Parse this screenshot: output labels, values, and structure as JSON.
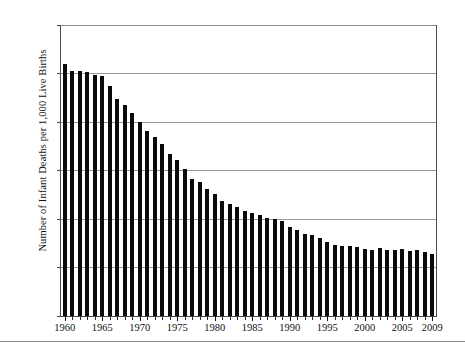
{
  "chart_data": {
    "type": "bar",
    "title": "",
    "subtitle": "",
    "xlabel": "",
    "ylabel": "Number of Infant Deaths per 1,000 Live Births",
    "ylim": [
      0,
      30
    ],
    "ytick_values": [
      0,
      5,
      10,
      15,
      20,
      25,
      30
    ],
    "ytick_labels": [
      "0",
      "5",
      "10",
      "15",
      "20",
      "25",
      "30"
    ],
    "xlim": [
      1960,
      2009
    ],
    "xtick_labels": [
      "1960",
      "1965",
      "1970",
      "1975",
      "1980",
      "1985",
      "1990",
      "1995",
      "2000",
      "2005",
      "2009"
    ],
    "xtick_years": [
      1960,
      1965,
      1970,
      1975,
      1980,
      1985,
      1990,
      1995,
      2000,
      2005,
      2009
    ],
    "grid": "horizontal",
    "legend": "none",
    "bar_color": "#0b0b0b",
    "grid_color": "#9a9a9a",
    "axis_color": "#4a4a4a",
    "categories": [
      "1960",
      "1961",
      "1962",
      "1963",
      "1964",
      "1965",
      "1966",
      "1967",
      "1968",
      "1969",
      "1970",
      "1971",
      "1972",
      "1973",
      "1974",
      "1975",
      "1976",
      "1977",
      "1978",
      "1979",
      "1980",
      "1981",
      "1982",
      "1983",
      "1984",
      "1985",
      "1986",
      "1987",
      "1988",
      "1989",
      "1990",
      "1991",
      "1992",
      "1993",
      "1994",
      "1995",
      "1996",
      "1997",
      "1998",
      "1999",
      "2000",
      "2001",
      "2002",
      "2003",
      "2004",
      "2005",
      "2006",
      "2007",
      "2008",
      "2009"
    ],
    "values": [
      26.0,
      25.3,
      25.3,
      25.2,
      24.8,
      24.7,
      23.7,
      22.4,
      21.8,
      20.9,
      20.0,
      19.1,
      18.5,
      17.7,
      16.7,
      16.1,
      15.2,
      14.1,
      13.8,
      13.1,
      12.6,
      11.9,
      11.5,
      11.2,
      10.8,
      10.6,
      10.4,
      10.1,
      10.0,
      9.8,
      9.2,
      8.9,
      8.5,
      8.4,
      8.0,
      7.6,
      7.3,
      7.2,
      7.2,
      7.1,
      6.9,
      6.8,
      7.0,
      6.8,
      6.8,
      6.9,
      6.7,
      6.8,
      6.6,
      6.4
    ]
  },
  "figure": {
    "y_axis_title": "Number of Infant Deaths per 1,000 Live Births"
  }
}
